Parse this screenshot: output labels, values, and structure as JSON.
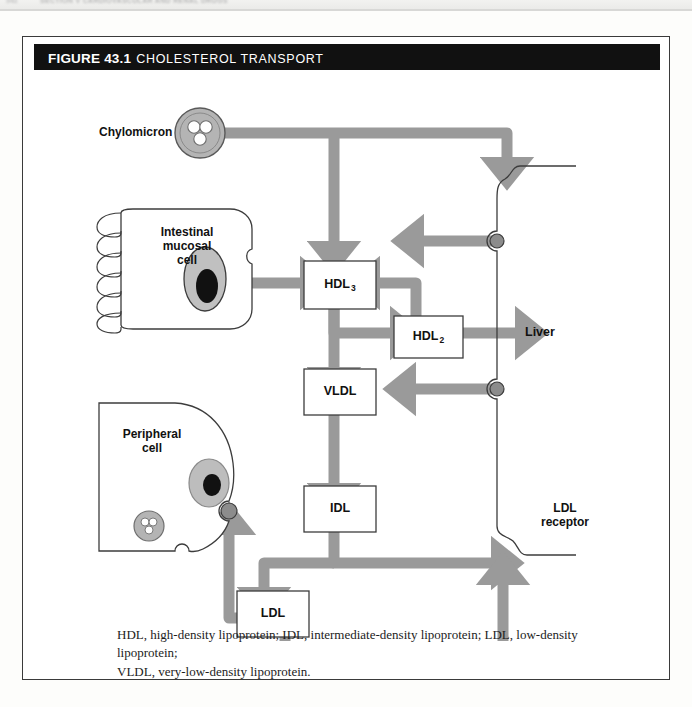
{
  "running_head": {
    "page_number": "542",
    "text": "SECTION V  CARDIOVASCULAR AND RENAL DRUGS"
  },
  "figure": {
    "title_prefix": "FIGURE 43.1",
    "title": "CHOLESTEROL TRANSPORT",
    "caption_line1": "HDL, high-density lipoprotein; IDL, intermediate-density lipoprotein; LDL, low-density lipoprotein;",
    "caption_line2": "VLDL, very-low-density lipoprotein."
  },
  "diagram": {
    "labels": {
      "chylomicron": "Chylomicron",
      "intestinal_cell_line1": "Intestinal",
      "intestinal_cell_line2": "mucosal",
      "intestinal_cell_line3": "cell",
      "peripheral_cell_line1": "Peripheral",
      "peripheral_cell_line2": "cell",
      "liver": "Liver",
      "ldl_receptor_line1": "LDL",
      "ldl_receptor_line2": "receptor"
    },
    "nodes": [
      {
        "id": "hdl3",
        "label": "HDL",
        "subscript": "3"
      },
      {
        "id": "hdl2",
        "label": "HDL",
        "subscript": "2"
      },
      {
        "id": "vldl",
        "label": "VLDL",
        "subscript": ""
      },
      {
        "id": "idl",
        "label": "IDL",
        "subscript": ""
      },
      {
        "id": "ldl",
        "label": "LDL",
        "subscript": ""
      }
    ],
    "colors": {
      "arrow": "#9a9a9a",
      "outline": "#3c3c3c",
      "cell_fill": "#ffffff",
      "particle_fill": "#b0b0b0",
      "nucleus_fill": "#b8b8b8",
      "nucleus_core": "#111111",
      "title_bar": "#111111"
    }
  }
}
